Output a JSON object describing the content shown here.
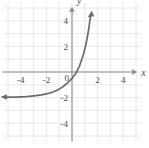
{
  "figure": {
    "background_color": "#ffffff",
    "grid_color": "#e8e6e6",
    "axis_color": "#8c8c8c",
    "curve_color": "#6b6b6b",
    "label_color": "#4a4a4a"
  },
  "chart_data": {
    "type": "line",
    "title": "",
    "subtitle": "",
    "xlabel": "x",
    "ylabel": "y",
    "xlim": [
      -5.4,
      5.4
    ],
    "ylim": [
      -5.4,
      5.4
    ],
    "grid": true,
    "grid_step": 1,
    "legend": "none",
    "x_ticks": [
      -4,
      -2,
      2,
      4
    ],
    "x_tick_labels": [
      "-4",
      "-2",
      "2",
      "4"
    ],
    "y_ticks": [
      4,
      2,
      -2,
      -4
    ],
    "y_tick_labels": [
      "4",
      "2",
      "-2",
      "-4"
    ],
    "origin_label": "0",
    "axis_arrows": [
      "x-positive",
      "y-positive"
    ],
    "series": [
      {
        "name": "exponential curve",
        "description": "increasing exponential with horizontal asymptote y = -2",
        "asymptote": -2,
        "arrow_start": "left",
        "arrow_end": "up",
        "x": [
          -5.2,
          -4.8,
          -4.4,
          -4.0,
          -3.6,
          -3.2,
          -2.8,
          -2.4,
          -2.0,
          -1.6,
          -1.2,
          -0.8,
          -0.4,
          0.0,
          0.3,
          0.6,
          0.9,
          1.1,
          1.3,
          1.45
        ],
        "y": [
          -1.98,
          -1.97,
          -1.96,
          -1.94,
          -1.92,
          -1.89,
          -1.85,
          -1.79,
          -1.71,
          -1.6,
          -1.44,
          -1.22,
          -0.9,
          -0.5,
          -0.1,
          0.5,
          1.4,
          2.2,
          3.3,
          4.4
        ]
      }
    ],
    "annotations": []
  }
}
